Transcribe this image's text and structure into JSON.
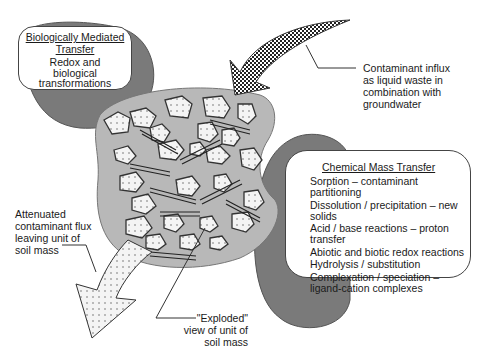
{
  "diagram": {
    "biological_box": {
      "title_line1": "Biologically Mediated",
      "title_line2": "Transfer",
      "body_line1": "Redox and",
      "body_line2": "biological",
      "body_line3": "transformations"
    },
    "influx_label": {
      "line1": "Contaminant influx",
      "line2": "as liquid waste in",
      "line3": "combination with",
      "line4": "groundwater"
    },
    "chemical_box": {
      "title": "Chemical Mass Transfer",
      "items": [
        {
          "line1": "Sorption – contaminant",
          "line2": "partitioning"
        },
        {
          "line1": "Dissolution / precipitation – new",
          "line2": "solids"
        },
        {
          "line1": "Acid / base reactions – proton",
          "line2": "transfer"
        },
        {
          "line1": "Abiotic and biotic redox reactions",
          "line2": ""
        },
        {
          "line1": "Hydrolysis / substitution",
          "line2": ""
        },
        {
          "line1": "Complexation / speciation –",
          "line2": "ligand-cation complexes"
        }
      ]
    },
    "outflux_label": {
      "line1": "Attenuated",
      "line2": "contaminant flux",
      "line3": "leaving unit of",
      "line4": "soil mass"
    },
    "exploded_label": {
      "line1": "\"Exploded\"",
      "line2": "view of unit of",
      "line3": "soil mass"
    },
    "colors": {
      "dark_gray_blob": "#7a7a7a",
      "soil_matrix": "#b8b8b8",
      "particle_fill": "#f2f2f2",
      "outline": "#333333"
    }
  }
}
